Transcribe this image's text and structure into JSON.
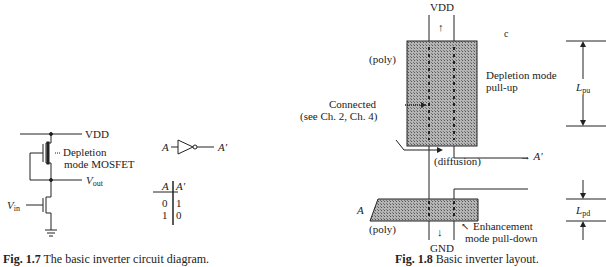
{
  "figure_17": {
    "caption_label": "Fig. 1.7",
    "caption_text": "The basic inverter circuit diagram.",
    "circuit": {
      "vdd_label": "VDD",
      "vout_label": "V",
      "vout_sub": "out",
      "vin_label": "V",
      "vin_sub": "in",
      "depletion_label_line1": "Depletion",
      "depletion_label_line2": "mode MOSFET"
    },
    "gate_symbol": {
      "input_label": "A",
      "output_label": "A′"
    },
    "truth_table": {
      "headers": [
        "A",
        "A′"
      ],
      "rows": [
        [
          "0",
          "1"
        ],
        [
          "1",
          "0"
        ]
      ]
    }
  },
  "figure_18": {
    "caption_label": "Fig. 1.8",
    "caption_text": "Basic inverter layout.",
    "labels": {
      "vdd": "VDD",
      "gnd": "GND",
      "poly_top": "(poly)",
      "poly_bottom": "(poly)",
      "diffusion": "(diffusion)",
      "depletion_line1": "Depletion mode",
      "depletion_line2": "pull-up",
      "connected_line1": "Connected",
      "connected_line2": "(see Ch. 2, Ch. 4)",
      "output": "→ A′",
      "input": "A",
      "enhancement_line1": "Enhancement",
      "enhancement_line2": "mode pull-down",
      "stray_mark": "c",
      "l_pu": "L",
      "l_pu_sub": "pu",
      "l_pd": "L",
      "l_pd_sub": "pd"
    },
    "colors": {
      "hatch_fill": "#9a9a9a",
      "ink": "#222222"
    }
  }
}
